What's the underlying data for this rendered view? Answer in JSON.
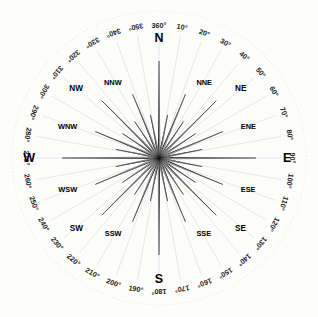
{
  "figure": {
    "type": "compass-rose",
    "background_color": "#fdfdfc",
    "ink_color": "#111111",
    "spoke_color": "#d9d9d9",
    "center": {
      "x": 159,
      "y": 158
    },
    "outer_ring_radius": 147,
    "label_ring_radius": 133
  },
  "chart_data": {
    "type": "compass-rose",
    "center": {
      "x": 159,
      "y": 158
    },
    "point_count": 32,
    "degree_labels": [
      {
        "text": "360°",
        "degrees": 0
      },
      {
        "text": "10°",
        "degrees": 10
      },
      {
        "text": "20°",
        "degrees": 20
      },
      {
        "text": "30°",
        "degrees": 30
      },
      {
        "text": "40°",
        "degrees": 40
      },
      {
        "text": "50°",
        "degrees": 50
      },
      {
        "text": "60°",
        "degrees": 60
      },
      {
        "text": "70°",
        "degrees": 70
      },
      {
        "text": "80°",
        "degrees": 80
      },
      {
        "text": "90°",
        "degrees": 90
      },
      {
        "text": "100°",
        "degrees": 100
      },
      {
        "text": "110°",
        "degrees": 110
      },
      {
        "text": "120°",
        "degrees": 120
      },
      {
        "text": "130°",
        "degrees": 130
      },
      {
        "text": "140°",
        "degrees": 140
      },
      {
        "text": "150°",
        "degrees": 150
      },
      {
        "text": "160°",
        "degrees": 160
      },
      {
        "text": "170°",
        "degrees": 170
      },
      {
        "text": "180°",
        "degrees": 180
      },
      {
        "text": "190°",
        "degrees": 190
      },
      {
        "text": "200°",
        "degrees": 200
      },
      {
        "text": "210°",
        "degrees": 210
      },
      {
        "text": "220°",
        "degrees": 220
      },
      {
        "text": "230°",
        "degrees": 230
      },
      {
        "text": "240°",
        "degrees": 240
      },
      {
        "text": "250°",
        "degrees": 250
      },
      {
        "text": "260°",
        "degrees": 260
      },
      {
        "text": "270°",
        "degrees": 270
      },
      {
        "text": "280°",
        "degrees": 280
      },
      {
        "text": "290°",
        "degrees": 290
      },
      {
        "text": "300°",
        "degrees": 300
      },
      {
        "text": "310°",
        "degrees": 310
      },
      {
        "text": "320°",
        "degrees": 320
      },
      {
        "text": "330°",
        "degrees": 330
      },
      {
        "text": "340°",
        "degrees": 340
      },
      {
        "text": "350°",
        "degrees": 350
      }
    ],
    "direction_labels": [
      {
        "text": "N",
        "degrees": 0,
        "tier": "cardinal",
        "radius": 118
      },
      {
        "text": "NNE",
        "degrees": 22.5,
        "tier": "secondary",
        "radius": 82
      },
      {
        "text": "NE",
        "degrees": 45,
        "tier": "intercardinal",
        "radius": 99
      },
      {
        "text": "ENE",
        "degrees": 67.5,
        "tier": "secondary",
        "radius": 82
      },
      {
        "text": "E",
        "degrees": 90,
        "tier": "cardinal",
        "radius": 118
      },
      {
        "text": "ESE",
        "degrees": 112.5,
        "tier": "secondary",
        "radius": 82
      },
      {
        "text": "SE",
        "degrees": 135,
        "tier": "intercardinal",
        "radius": 99
      },
      {
        "text": "SSE",
        "degrees": 157.5,
        "tier": "secondary",
        "radius": 82
      },
      {
        "text": "S",
        "degrees": 180,
        "tier": "cardinal",
        "radius": 118
      },
      {
        "text": "SSW",
        "degrees": 202.5,
        "tier": "secondary",
        "radius": 82
      },
      {
        "text": "SW",
        "degrees": 225,
        "tier": "intercardinal",
        "radius": 99
      },
      {
        "text": "WSW",
        "degrees": 247.5,
        "tier": "secondary",
        "radius": 82
      },
      {
        "text": "W",
        "degrees": 270,
        "tier": "cardinal",
        "radius": 118
      },
      {
        "text": "WNW",
        "degrees": 292.5,
        "tier": "secondary",
        "radius": 82
      },
      {
        "text": "NW",
        "degrees": 315,
        "tier": "intercardinal",
        "radius": 99
      },
      {
        "text": "NNW",
        "degrees": 337.5,
        "tier": "secondary",
        "radius": 82
      }
    ],
    "point_radii": {
      "cardinal": 97,
      "intercardinal": 81,
      "secondary": 69,
      "sixteenth": 44
    },
    "point_half_width_deg": 4.0,
    "spoke_tick_interval_degrees": 10
  }
}
